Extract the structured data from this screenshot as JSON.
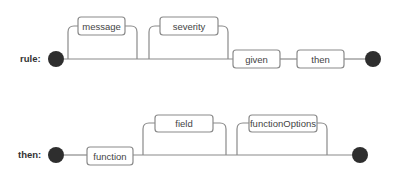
{
  "diagrams": [
    {
      "name": "rule",
      "label": "rule:",
      "elements": {
        "optional_1": "message",
        "optional_2": "severity",
        "required_1": "given",
        "required_2": "then"
      }
    },
    {
      "name": "then",
      "label": "then:",
      "elements": {
        "required_1": "function",
        "optional_1": "field",
        "optional_2": "functionOptions"
      }
    }
  ],
  "colors": {
    "line": "#8a8a8a",
    "node": "#2e2e2e",
    "text": "#444444"
  }
}
